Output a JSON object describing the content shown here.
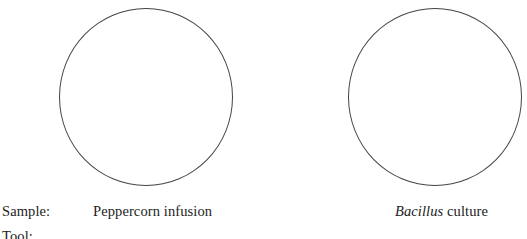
{
  "rows": [
    {
      "label": "Sample:"
    },
    {
      "label": "Tool:"
    }
  ],
  "samples": [
    {
      "name": "Peppercorn infusion",
      "italic_part": "",
      "rest": "Peppercorn infusion"
    },
    {
      "name": "Bacillus culture",
      "italic_part": "Bacillus",
      "rest": " culture"
    }
  ]
}
